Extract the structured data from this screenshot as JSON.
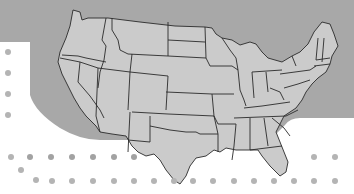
{
  "figure": {
    "colors": {
      "page_background": "#ffffff",
      "panel_background": "#a8a8a8",
      "land_fill": "#cbcbcb",
      "state_border": "#2a2a2a",
      "dot": "#b4b4b4",
      "dot_dark": "#a2a2a2"
    }
  },
  "map": {
    "region": "Contiguous United States",
    "style": "state boundaries, no labels"
  },
  "dots": {
    "left_column": [
      {
        "x": 8,
        "y": 52
      },
      {
        "x": 8,
        "y": 73
      },
      {
        "x": 8,
        "y": 94
      },
      {
        "x": 8,
        "y": 115
      }
    ],
    "middle_row": [
      {
        "x": 11,
        "y": 157
      },
      {
        "x": 30,
        "y": 157
      },
      {
        "x": 51,
        "y": 157
      },
      {
        "x": 72,
        "y": 157
      },
      {
        "x": 93,
        "y": 157
      },
      {
        "x": 114,
        "y": 157
      },
      {
        "x": 134,
        "y": 157
      },
      {
        "x": 314,
        "y": 157
      },
      {
        "x": 335,
        "y": 157
      }
    ],
    "diagonal": [
      {
        "x": 21,
        "y": 170
      }
    ],
    "bottom_row": [
      {
        "x": 36,
        "y": 180
      },
      {
        "x": 52,
        "y": 180
      },
      {
        "x": 72,
        "y": 180
      },
      {
        "x": 93,
        "y": 180
      },
      {
        "x": 114,
        "y": 180
      },
      {
        "x": 134,
        "y": 180
      },
      {
        "x": 154,
        "y": 180
      },
      {
        "x": 174,
        "y": 180
      },
      {
        "x": 193,
        "y": 180
      },
      {
        "x": 213,
        "y": 180
      },
      {
        "x": 234,
        "y": 180
      },
      {
        "x": 254,
        "y": 180
      },
      {
        "x": 274,
        "y": 180
      },
      {
        "x": 294,
        "y": 180
      },
      {
        "x": 314,
        "y": 180
      },
      {
        "x": 335,
        "y": 180
      }
    ]
  }
}
